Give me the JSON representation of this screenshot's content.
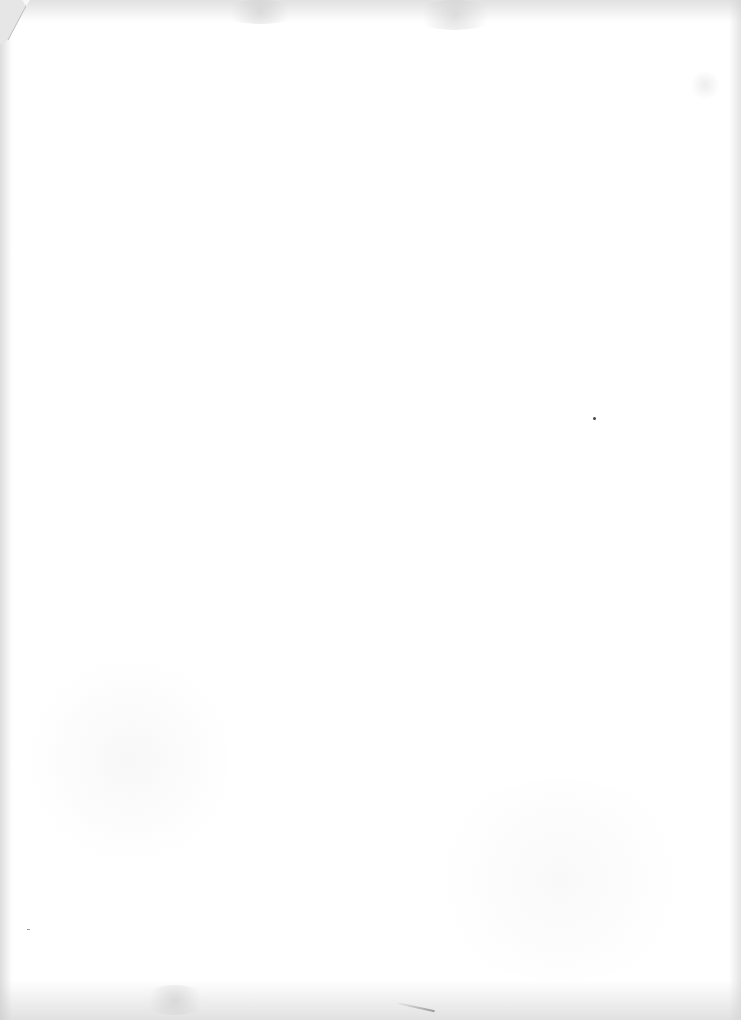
{
  "document": {
    "type": "scanned-page",
    "content": "",
    "background_color": "#ffffff",
    "edge_shade_color": "#c8c8c8"
  }
}
